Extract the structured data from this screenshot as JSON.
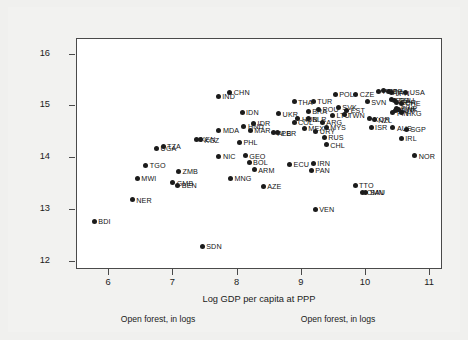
{
  "figure": {
    "background_color": "#f0f0ee",
    "plot_background_color": "#ffffff",
    "frame_color": "#4a4a4a",
    "marker_color": "#1b1b1b",
    "caption_left": "Open forest, in logs",
    "caption_right": "Open forest, in logs"
  },
  "chart_data": {
    "type": "scatter",
    "title": "",
    "xlabel": "Log GDP per capita at PPP",
    "ylabel": "Open forest, in logs",
    "xlim": [
      5.5,
      11.2
    ],
    "ylim": [
      11.85,
      16.3
    ],
    "xticks": [
      6,
      7,
      8,
      9,
      10,
      11
    ],
    "yticks": [
      12,
      13,
      14,
      15,
      16
    ],
    "xticklabels": [
      "6",
      "7",
      "8",
      "9",
      "10",
      "11"
    ],
    "yticklabels": [
      "12",
      "13",
      "14",
      "15",
      "16"
    ],
    "grid": false,
    "legend": "none",
    "marker": "filled-circle",
    "label_position": "right-of-marker",
    "points": [
      {
        "label": "BDI",
        "x": 5.77,
        "y": 12.79
      },
      {
        "label": "NER",
        "x": 6.36,
        "y": 13.2
      },
      {
        "label": "MWI",
        "x": 6.44,
        "y": 13.61
      },
      {
        "label": "TGO",
        "x": 6.57,
        "y": 13.86
      },
      {
        "label": "UGA",
        "x": 6.74,
        "y": 14.2
      },
      {
        "label": "TZA",
        "x": 6.84,
        "y": 14.23
      },
      {
        "label": "GMB",
        "x": 6.99,
        "y": 13.53
      },
      {
        "label": "BEN",
        "x": 7.07,
        "y": 13.48
      },
      {
        "label": "ZMB",
        "x": 7.08,
        "y": 13.75
      },
      {
        "label": "KEN",
        "x": 7.36,
        "y": 14.37
      },
      {
        "label": "KGZ",
        "x": 7.42,
        "y": 14.36
      },
      {
        "label": "SDN",
        "x": 7.45,
        "y": 12.3
      },
      {
        "label": "IND",
        "x": 7.7,
        "y": 15.2
      },
      {
        "label": "NIC",
        "x": 7.71,
        "y": 14.04
      },
      {
        "label": "MDA",
        "x": 7.71,
        "y": 14.54
      },
      {
        "label": "CHN",
        "x": 7.88,
        "y": 15.27
      },
      {
        "label": "MNG",
        "x": 7.89,
        "y": 13.62
      },
      {
        "label": "IDN",
        "x": 8.07,
        "y": 14.89
      },
      {
        "label": "HND",
        "x": 8.1,
        "y": 14.62
      },
      {
        "label": "GEO",
        "x": 8.12,
        "y": 14.05
      },
      {
        "label": "PHL",
        "x": 8.03,
        "y": 14.31
      },
      {
        "label": "BOL",
        "x": 8.18,
        "y": 13.93
      },
      {
        "label": "MAR",
        "x": 8.2,
        "y": 14.54
      },
      {
        "label": "IDR",
        "x": 8.25,
        "y": 14.68
      },
      {
        "label": "ARM",
        "x": 8.26,
        "y": 13.78
      },
      {
        "label": "AZE",
        "x": 8.4,
        "y": 13.46
      },
      {
        "label": "ALB",
        "x": 8.56,
        "y": 14.49
      },
      {
        "label": "PER",
        "x": 8.62,
        "y": 14.49
      },
      {
        "label": "UKR",
        "x": 8.64,
        "y": 14.86
      },
      {
        "label": "THA",
        "x": 8.88,
        "y": 15.09
      },
      {
        "label": "ECU",
        "x": 8.81,
        "y": 13.88
      },
      {
        "label": "HUN",
        "x": 8.94,
        "y": 14.76
      },
      {
        "label": "COL",
        "x": 8.88,
        "y": 14.69
      },
      {
        "label": "MEX",
        "x": 9.04,
        "y": 14.58
      },
      {
        "label": "BLR",
        "x": 9.1,
        "y": 14.76
      },
      {
        "label": "TUR",
        "x": 9.18,
        "y": 15.1
      },
      {
        "label": "IRN",
        "x": 9.18,
        "y": 13.9
      },
      {
        "label": "PAN",
        "x": 9.15,
        "y": 13.77
      },
      {
        "label": "VEN",
        "x": 9.21,
        "y": 13.02
      },
      {
        "label": "BRA",
        "x": 9.1,
        "y": 14.91
      },
      {
        "label": "URY",
        "x": 9.22,
        "y": 14.52
      },
      {
        "label": "ARG",
        "x": 9.32,
        "y": 14.7
      },
      {
        "label": "ROU",
        "x": 9.26,
        "y": 14.95
      },
      {
        "label": "MYS",
        "x": 9.38,
        "y": 14.6
      },
      {
        "label": "RUS",
        "x": 9.35,
        "y": 14.4
      },
      {
        "label": "CHL",
        "x": 9.38,
        "y": 14.26
      },
      {
        "label": "POL",
        "x": 9.52,
        "y": 15.23
      },
      {
        "label": "LTU",
        "x": 9.48,
        "y": 14.83
      },
      {
        "label": "SVK",
        "x": 9.57,
        "y": 14.98
      },
      {
        "label": "TWN",
        "x": 9.66,
        "y": 14.84
      },
      {
        "label": "EST",
        "x": 9.7,
        "y": 14.93
      },
      {
        "label": "CZE",
        "x": 9.84,
        "y": 15.23
      },
      {
        "label": "TTO",
        "x": 9.83,
        "y": 13.48
      },
      {
        "label": "OMN",
        "x": 9.95,
        "y": 13.35
      },
      {
        "label": "SAU",
        "x": 10.0,
        "y": 13.34
      },
      {
        "label": "SVN",
        "x": 10.02,
        "y": 15.09
      },
      {
        "label": "KOR",
        "x": 10.06,
        "y": 14.76
      },
      {
        "label": "NZL",
        "x": 10.13,
        "y": 14.74
      },
      {
        "label": "ISR",
        "x": 10.08,
        "y": 14.6
      },
      {
        "label": "PRT",
        "x": 10.2,
        "y": 15.29
      },
      {
        "label": "ESP",
        "x": 10.28,
        "y": 15.3
      },
      {
        "label": "ITA",
        "x": 10.35,
        "y": 15.28
      },
      {
        "label": "JPN",
        "x": 10.4,
        "y": 15.26
      },
      {
        "label": "USA",
        "x": 10.62,
        "y": 15.27
      },
      {
        "label": "FRA",
        "x": 10.4,
        "y": 15.13
      },
      {
        "label": "DEU",
        "x": 10.45,
        "y": 15.12
      },
      {
        "label": "GBR",
        "x": 10.47,
        "y": 15.08
      },
      {
        "label": "CHE",
        "x": 10.55,
        "y": 15.06
      },
      {
        "label": "SWE",
        "x": 10.48,
        "y": 14.97
      },
      {
        "label": "DNK",
        "x": 10.5,
        "y": 14.95
      },
      {
        "label": "AUT",
        "x": 10.46,
        "y": 14.92
      },
      {
        "label": "FIN",
        "x": 10.42,
        "y": 14.88
      },
      {
        "label": "HKG",
        "x": 10.56,
        "y": 14.88
      },
      {
        "label": "AUS",
        "x": 10.42,
        "y": 14.59
      },
      {
        "label": "SGP",
        "x": 10.63,
        "y": 14.56
      },
      {
        "label": "IRL",
        "x": 10.55,
        "y": 14.38
      },
      {
        "label": "NOR",
        "x": 10.76,
        "y": 14.05
      }
    ]
  }
}
